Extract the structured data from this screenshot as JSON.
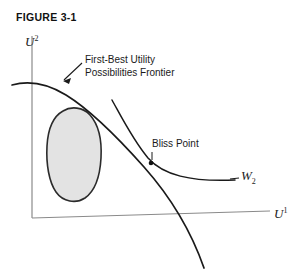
{
  "figure": {
    "title": "FIGURE 3-1",
    "axes": {
      "y_label_base": "U",
      "y_label_sup": "2",
      "x_label_base": "U",
      "x_label_sup": "1"
    },
    "annotations": {
      "frontier_line1": "First-Best Utility",
      "frontier_line2": "Possibilities Frontier",
      "bliss_point": "Bliss Point",
      "curve_w2_base": "W",
      "curve_w2_sub": "2"
    },
    "colors": {
      "background": "#ffffff",
      "axis": "#8a8a8a",
      "curve": "#1a1a1a",
      "region_fill": "#e2e2e2",
      "region_stroke": "#2b2b2b",
      "text": "#111111"
    }
  }
}
